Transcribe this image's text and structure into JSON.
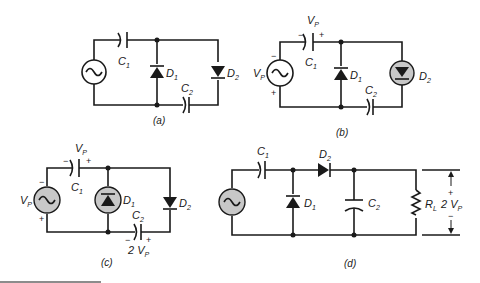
{
  "colors": {
    "ink": "#1a1a1a",
    "highlight": "#c8c8c8",
    "background": "#ffffff"
  },
  "circuits": {
    "a": {
      "caption": "(a)",
      "C1": "C",
      "C1_sub": "1",
      "C2": "C",
      "C2_sub": "2",
      "D1": "D",
      "D1_sub": "1",
      "D2": "D",
      "D2_sub": "2",
      "source_icon": "ac-source-icon"
    },
    "b": {
      "caption": "(b)",
      "C1": "C",
      "C1_sub": "1",
      "C2": "C",
      "C2_sub": "2",
      "D1": "D",
      "D1_sub": "1",
      "D2": "D",
      "D2_sub": "2",
      "Vp": "V",
      "Vp_sub": "P",
      "cap_voltage": "V",
      "cap_voltage_sub": "P",
      "minus": "−",
      "plus": "+",
      "highlighted": "D2"
    },
    "c": {
      "caption": "(c)",
      "C1": "C",
      "C1_sub": "1",
      "C2": "C",
      "C2_sub": "2",
      "D1": "D",
      "D1_sub": "1",
      "D2": "D",
      "D2_sub": "2",
      "Vp": "V",
      "Vp_sub": "P",
      "cap_voltage": "V",
      "cap_voltage_sub": "P",
      "c2_voltage": "2 V",
      "c2_voltage_sub": "P",
      "minus": "−",
      "plus": "+",
      "highlighted": "D1 and source"
    },
    "d": {
      "caption": "(d)",
      "C1": "C",
      "C1_sub": "1",
      "C2": "C",
      "C2_sub": "2",
      "D1": "D",
      "D1_sub": "1",
      "D2": "D",
      "D2_sub": "2",
      "RL": "R",
      "RL_sub": "L",
      "out": "2 V",
      "out_sub": "P",
      "minus": "−",
      "plus": "+"
    }
  }
}
